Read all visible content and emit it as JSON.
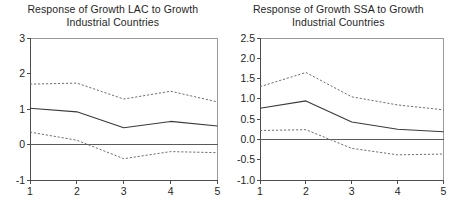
{
  "figure": {
    "panel_count": 2
  },
  "panels": [
    {
      "id": "lac",
      "title_line1": "Response of Growth LAC to Growth",
      "title_line2": "Industrial Countries",
      "chart_data": {
        "type": "line",
        "title": "Response of Growth LAC to Growth Industrial Countries",
        "xlabel": "",
        "ylabel": "",
        "x": [
          1,
          2,
          3,
          4,
          5
        ],
        "xlim": [
          1,
          5
        ],
        "ylim": [
          -1,
          3
        ],
        "xticks": [
          "1",
          "2",
          "3",
          "4",
          "5"
        ],
        "yticks": [
          "-1",
          "0",
          "1",
          "2",
          "3"
        ],
        "ytick_values": [
          -1,
          0,
          1,
          2,
          3
        ],
        "grid": false,
        "legend": "none",
        "zero_line": 0,
        "series": [
          {
            "name": "Upper confidence band",
            "style": "dashed",
            "values": [
              1.7,
              1.73,
              1.28,
              1.5,
              1.2
            ]
          },
          {
            "name": "Impulse response",
            "style": "solid",
            "values": [
              1.02,
              0.92,
              0.47,
              0.65,
              0.52
            ]
          },
          {
            "name": "Lower confidence band",
            "style": "dashed",
            "values": [
              0.35,
              0.12,
              -0.4,
              -0.2,
              -0.23
            ]
          }
        ]
      }
    },
    {
      "id": "ssa",
      "title_line1": "Response of Growth SSA to Growth",
      "title_line2": "Industrial Countries",
      "chart_data": {
        "type": "line",
        "title": "Response of Growth SSA to Growth Industrial Countries",
        "xlabel": "",
        "ylabel": "",
        "x": [
          1,
          2,
          3,
          4,
          5
        ],
        "xlim": [
          1,
          5
        ],
        "ylim": [
          -1.0,
          2.5
        ],
        "xticks": [
          "1",
          "2",
          "3",
          "4",
          "5"
        ],
        "yticks": [
          "-1.0",
          "-0.5",
          "0.0",
          "0.5",
          "1.0",
          "1.5",
          "2.0",
          "2.5"
        ],
        "ytick_values": [
          -1.0,
          -0.5,
          0.0,
          0.5,
          1.0,
          1.5,
          2.0,
          2.5
        ],
        "grid": false,
        "legend": "none",
        "zero_line": 0,
        "series": [
          {
            "name": "Upper confidence band",
            "style": "dashed",
            "values": [
              1.3,
              1.65,
              1.05,
              0.85,
              0.73
            ]
          },
          {
            "name": "Impulse response",
            "style": "solid",
            "values": [
              0.77,
              0.95,
              0.43,
              0.25,
              0.19
            ]
          },
          {
            "name": "Lower confidence band",
            "style": "dashed",
            "values": [
              0.22,
              0.24,
              -0.22,
              -0.38,
              -0.36
            ]
          }
        ]
      }
    }
  ]
}
